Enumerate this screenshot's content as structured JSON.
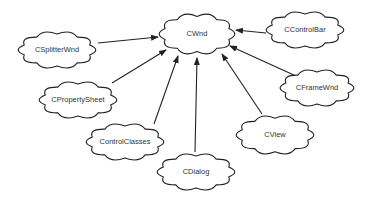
{
  "diagram": {
    "type": "class-hierarchy",
    "colors": {
      "stroke": "#222222",
      "fill": "#ffffff",
      "text": "#333333",
      "background": "#ffffff"
    },
    "nodes": [
      {
        "id": "cwnd",
        "label": "CWnd",
        "cx": 197,
        "cy": 34,
        "w": 78,
        "h": 44
      },
      {
        "id": "csplitterwnd",
        "label": "CSplitterWnd",
        "cx": 57,
        "cy": 50,
        "w": 80,
        "h": 40
      },
      {
        "id": "ccontrolbar",
        "label": "CControlBar",
        "cx": 305,
        "cy": 30,
        "w": 80,
        "h": 40
      },
      {
        "id": "cpropertysheet",
        "label": "CPropertySheet",
        "cx": 78,
        "cy": 100,
        "w": 80,
        "h": 40
      },
      {
        "id": "cframewnd",
        "label": "CFrameWnd",
        "cx": 317,
        "cy": 88,
        "w": 76,
        "h": 40
      },
      {
        "id": "controlclasses",
        "label": "ControlClasses",
        "cx": 125,
        "cy": 142,
        "w": 80,
        "h": 40
      },
      {
        "id": "cview",
        "label": "CView",
        "cx": 275,
        "cy": 135,
        "w": 80,
        "h": 42
      },
      {
        "id": "cdialog",
        "label": "CDialog",
        "cx": 196,
        "cy": 172,
        "w": 80,
        "h": 40
      }
    ],
    "edges": [
      {
        "from": "csplitterwnd",
        "to": "cwnd",
        "x1": 98,
        "y1": 43,
        "x2": 158,
        "y2": 37
      },
      {
        "from": "ccontrolbar",
        "to": "cwnd",
        "x1": 266,
        "y1": 33,
        "x2": 236,
        "y2": 30
      },
      {
        "from": "cpropertysheet",
        "to": "cwnd",
        "x1": 112,
        "y1": 83,
        "x2": 166,
        "y2": 50
      },
      {
        "from": "cframewnd",
        "to": "cwnd",
        "x1": 296,
        "y1": 76,
        "x2": 230,
        "y2": 46
      },
      {
        "from": "controlclasses",
        "to": "cwnd",
        "x1": 154,
        "y1": 124,
        "x2": 178,
        "y2": 56
      },
      {
        "from": "cview",
        "to": "cwnd",
        "x1": 262,
        "y1": 114,
        "x2": 222,
        "y2": 54
      },
      {
        "from": "cdialog",
        "to": "cwnd",
        "x1": 195,
        "y1": 152,
        "x2": 197,
        "y2": 58
      }
    ]
  }
}
